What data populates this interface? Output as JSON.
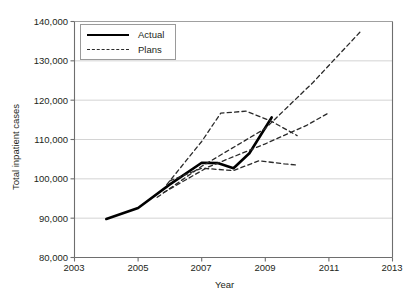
{
  "chart_data": {
    "type": "line",
    "title": "",
    "xlabel": "Year",
    "ylabel": "Total inpatient cases",
    "xlim": [
      2003,
      2013
    ],
    "ylim": [
      80000,
      140000
    ],
    "xticks": [
      2003,
      2005,
      2007,
      2009,
      2011,
      2013
    ],
    "xticklabels": [
      "2003",
      "2005",
      "2007",
      "2009",
      "2011",
      "2013"
    ],
    "yticks": [
      80000,
      90000,
      100000,
      110000,
      120000,
      130000,
      140000
    ],
    "yticklabels": [
      "80,000",
      "90,000",
      "100,000",
      "110,000",
      "120,000",
      "130,000",
      "140,000"
    ],
    "grid": "horizontal",
    "legend_position": "upper-left-inside",
    "legend": [
      {
        "name": "Actual",
        "style": "solid"
      },
      {
        "name": "Plans",
        "style": "dashed"
      }
    ],
    "series": [
      {
        "name": "Actual",
        "style": "solid",
        "color": "#000000",
        "points": [
          {
            "x": 2004.0,
            "y": 89800
          },
          {
            "x": 2005.0,
            "y": 92600
          },
          {
            "x": 2006.0,
            "y": 98600
          },
          {
            "x": 2007.0,
            "y": 104100
          },
          {
            "x": 2007.5,
            "y": 104000
          },
          {
            "x": 2008.0,
            "y": 102700
          },
          {
            "x": 2008.5,
            "y": 106500
          },
          {
            "x": 2009.2,
            "y": 115600
          }
        ]
      },
      {
        "name": "Plan A (steep growth)",
        "style": "dashed",
        "color": "#2a2a2a",
        "points": [
          {
            "x": 2005.6,
            "y": 95300
          },
          {
            "x": 2007.0,
            "y": 103200
          },
          {
            "x": 2009.0,
            "y": 112800
          },
          {
            "x": 2010.5,
            "y": 124500
          },
          {
            "x": 2012.0,
            "y": 137500
          }
        ]
      },
      {
        "name": "Plan B (moderate growth)",
        "style": "dashed",
        "color": "#2a2a2a",
        "points": [
          {
            "x": 2005.8,
            "y": 96500
          },
          {
            "x": 2007.2,
            "y": 103000
          },
          {
            "x": 2009.0,
            "y": 108900
          },
          {
            "x": 2010.3,
            "y": 113600
          },
          {
            "x": 2011.0,
            "y": 116800
          }
        ]
      },
      {
        "name": "Plan C (early peak then flat)",
        "style": "dashed",
        "color": "#2a2a2a",
        "points": [
          {
            "x": 2005.9,
            "y": 98500
          },
          {
            "x": 2007.0,
            "y": 109500
          },
          {
            "x": 2007.6,
            "y": 116700
          },
          {
            "x": 2008.4,
            "y": 117200
          },
          {
            "x": 2009.2,
            "y": 114600
          },
          {
            "x": 2010.0,
            "y": 111000
          }
        ]
      },
      {
        "name": "Plan D (flat plateau)",
        "style": "dashed",
        "color": "#2a2a2a",
        "points": [
          {
            "x": 2006.0,
            "y": 99500
          },
          {
            "x": 2007.0,
            "y": 102700
          },
          {
            "x": 2008.0,
            "y": 102100
          },
          {
            "x": 2008.8,
            "y": 104600
          },
          {
            "x": 2009.6,
            "y": 103800
          },
          {
            "x": 2010.0,
            "y": 103500
          }
        ]
      }
    ]
  }
}
